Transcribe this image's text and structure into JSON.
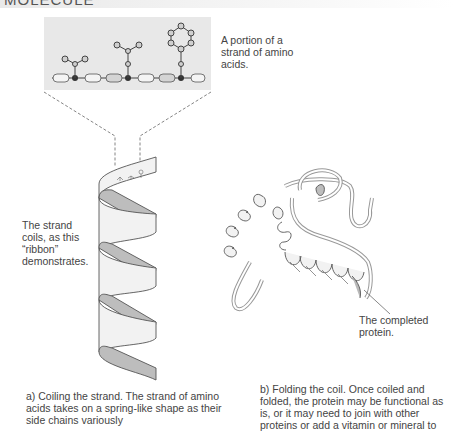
{
  "header": {
    "title": "MOLECULE"
  },
  "labels": {
    "portion": "A portion of a strand of amino acids.",
    "strand_coils": "The strand coils, as this “ribbon” demonstrates.",
    "completed": "The completed protein."
  },
  "captions": {
    "a": "a) Coiling the strand. The strand of amino acids takes on a spring-like shape as their side chains variously",
    "b": "b) Folding the coil. Once coiled and folded, the protein may be functional as is, or it may need to join with other proteins or add a vitamin or mineral to"
  },
  "colors": {
    "inset_bg": "#e8e8e8",
    "ribbon_light": "#f2f2f2",
    "ribbon_dark": "#b9b9b9",
    "outline": "#555555"
  }
}
